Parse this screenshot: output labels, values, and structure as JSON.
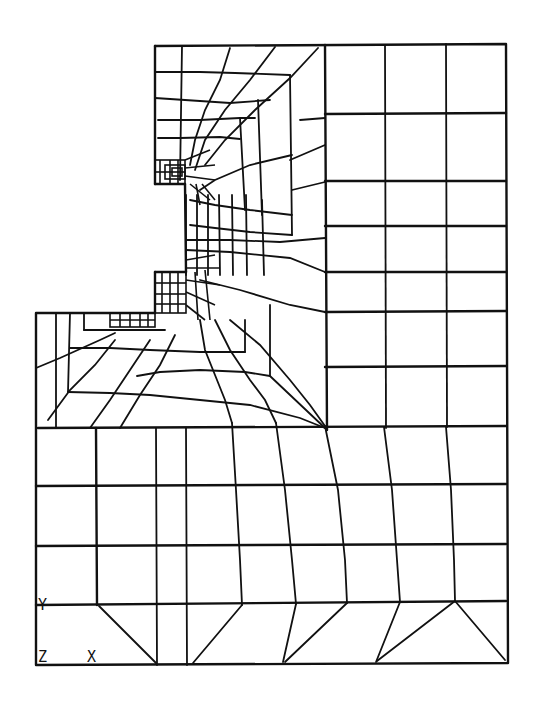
{
  "figure": {
    "type": "finite-element-mesh",
    "line_color": "#111111",
    "background": "#ffffff"
  },
  "axis_triad": {
    "y_label": "Y",
    "z_label": "Z",
    "x_label": "X"
  }
}
